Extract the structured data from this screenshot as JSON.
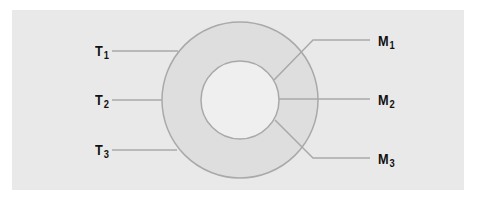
{
  "diagram": {
    "type": "concentric-rings",
    "colors": {
      "panel_background": "#e9e9e9",
      "outer_ring_fill": "#dedede",
      "inner_circle_fill": "#efefef",
      "stroke": "#a9a9a9",
      "label_text": "#111111"
    },
    "left_labels": [
      {
        "letter": "T",
        "sub": "1"
      },
      {
        "letter": "T",
        "sub": "2"
      },
      {
        "letter": "T",
        "sub": "3"
      }
    ],
    "right_labels": [
      {
        "letter": "M",
        "sub": "1"
      },
      {
        "letter": "M",
        "sub": "2"
      },
      {
        "letter": "M",
        "sub": "3"
      }
    ]
  }
}
